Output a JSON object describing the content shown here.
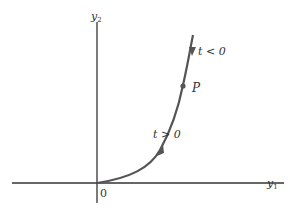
{
  "diagram": {
    "axes": {
      "x_label": "y",
      "x_label_sub": "1",
      "y_label": "y",
      "y_label_sub": "2",
      "origin_label": "0"
    },
    "curve": {
      "point_label": "P",
      "upper_label": "t < 0",
      "lower_label": "t > 0",
      "color": "#555555"
    },
    "colors": {
      "axis": "#333333",
      "background": "#ffffff"
    }
  }
}
